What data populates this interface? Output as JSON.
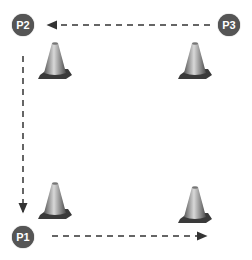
{
  "diagram": {
    "points": [
      {
        "id": "p1",
        "label": "P1"
      },
      {
        "id": "p2",
        "label": "P2"
      },
      {
        "id": "p3",
        "label": "P3"
      }
    ],
    "cones": 4,
    "paths": [
      {
        "from": "P3",
        "to": "P2",
        "direction": "left"
      },
      {
        "from": "P2",
        "to": "P1",
        "direction": "down"
      },
      {
        "from": "P1",
        "to": "right",
        "direction": "right"
      }
    ],
    "colors": {
      "label_bg": "#555555",
      "label_text": "#ffffff",
      "arrow": "#333333",
      "cone_base": "#3a3a3a"
    }
  }
}
